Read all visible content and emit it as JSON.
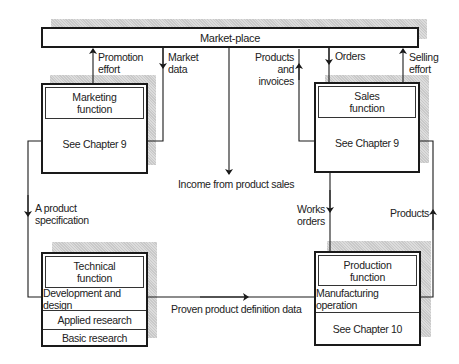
{
  "diagram": {
    "marketplace": {
      "label": "Market-place"
    },
    "boxes": {
      "marketing": {
        "title": "Marketing function",
        "title_line1": "Marketing",
        "title_line2": "function",
        "body": "See Chapter 9"
      },
      "sales": {
        "title": "Sales function",
        "title_line1": "Sales",
        "title_line2": "function",
        "body": "See Chapter 9"
      },
      "technical": {
        "title": "Technical function",
        "title_line1": "Technical",
        "title_line2": "function",
        "rows": [
          "Development and design",
          "Applied research",
          "Basic research"
        ]
      },
      "production": {
        "title": "Production function",
        "title_line1": "Production",
        "title_line2": "function",
        "rows": [
          "Manufacturing operation",
          "See Chapter 10"
        ]
      }
    },
    "flows": {
      "promotion_effort": {
        "line1": "Promotion",
        "line2": "effort"
      },
      "market_data": {
        "line1": "Market",
        "line2": "data"
      },
      "products_invoices": {
        "line1": "Products",
        "line2": "and",
        "line3": "invoices"
      },
      "orders": {
        "line1": "Orders"
      },
      "selling_effort": {
        "line1": "Selling",
        "line2": "effort"
      },
      "income": {
        "line1": "Income from product sales"
      },
      "product_spec": {
        "line1": "A product",
        "line2": "specification"
      },
      "works_orders": {
        "line1": "Works",
        "line2": "orders"
      },
      "products": {
        "line1": "Products"
      },
      "proven_data": {
        "line1": "Proven product definition data"
      }
    },
    "colors": {
      "line": "#1a1a1a",
      "shadow": "#d0d0d0",
      "background": "#ffffff"
    }
  }
}
